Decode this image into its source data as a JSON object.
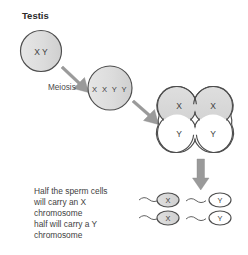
{
  "diagram": {
    "title": "Testis",
    "stage_label": "Meiosis",
    "background_color": "#ffffff",
    "outline_color": "#4d4d4d",
    "arrow_color": "#9a9a9a",
    "shaded_cell_color": "#d9d9d9",
    "unshaded_cell_color": "#ffffff",
    "germ_cell": {
      "name": "spermatogonium",
      "label": "X Y",
      "shaded": true
    },
    "duplicated_cell": {
      "name": "primary-spermatocyte",
      "label": "X X Y Y",
      "shaded": true
    },
    "tetrad_cells": [
      {
        "label": "X",
        "shaded": true
      },
      {
        "label": "X",
        "shaded": true
      },
      {
        "label": "Y",
        "shaded": false
      },
      {
        "label": "Y",
        "shaded": false
      }
    ],
    "caption_lines": [
      "Half the sperm cells",
      "will carry an X",
      "chromosome",
      "half will carry a Y",
      "chromosome"
    ],
    "sperm_cells": [
      {
        "label": "X",
        "shaded": true
      },
      {
        "label": "Y",
        "shaded": false
      },
      {
        "label": "X",
        "shaded": true
      },
      {
        "label": "Y",
        "shaded": false
      }
    ],
    "arrows": [
      {
        "name": "meiosis-arrow-one",
        "direction": "down-right"
      },
      {
        "name": "meiosis-arrow-two",
        "direction": "down-right"
      },
      {
        "name": "sperm-arrow",
        "direction": "down"
      }
    ]
  }
}
